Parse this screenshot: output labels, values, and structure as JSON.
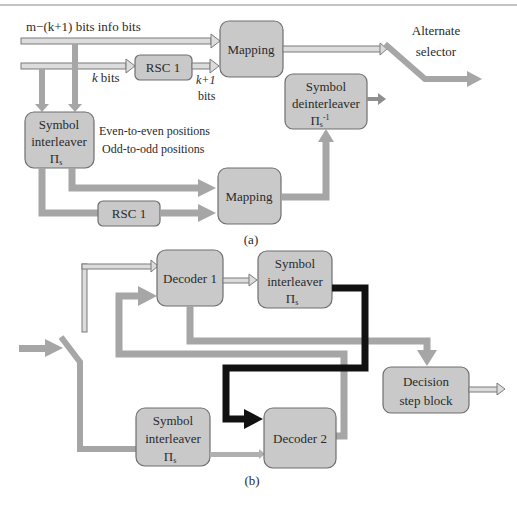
{
  "header_rule": true,
  "diagram_a": {
    "caption": "(a)",
    "inputs": {
      "info_bits_label": "m−(k+1) bits info bits",
      "k_bits_label": "k bits",
      "k_plus_1_label": "k+1",
      "k_plus_1_bits_word": "bits"
    },
    "blocks": {
      "mapping_top": "Mapping",
      "rsc_top": "RSC 1",
      "symbol_deinterleaver": [
        "Symbol",
        "deinterleaver",
        "Π",
        "s",
        "-1"
      ],
      "symbol_interleaver": [
        "Symbol",
        "interleaver",
        "Π",
        "s"
      ],
      "mapping_bottom": "Mapping",
      "rsc_bottom": "RSC 1"
    },
    "notes": {
      "even": "Even-to-even positions",
      "odd": "Odd-to-odd positions"
    },
    "selector": [
      "Alternate",
      "selector"
    ]
  },
  "diagram_b": {
    "caption": "(b)",
    "blocks": {
      "decoder1": "Decoder 1",
      "symbol_interleaver_top": [
        "Symbol",
        "interleaver",
        "Π",
        "s"
      ],
      "symbol_interleaver_bottom": [
        "Symbol",
        "interleaver",
        "Π",
        "s"
      ],
      "decoder2": "Decoder 2",
      "decision": [
        "Decision",
        "step block"
      ]
    }
  },
  "colors": {
    "box_fill": "#c9c9c9",
    "box_stroke": "#6f6f6f",
    "thick_arrow": "#a6a6a6",
    "feedback_arrow": "#111111",
    "hollow_arrow": "#dcdcdc"
  }
}
